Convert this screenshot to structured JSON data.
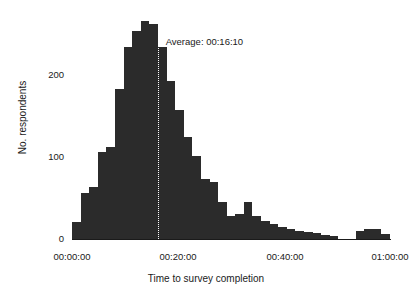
{
  "chart_data": {
    "type": "bar",
    "title": "",
    "subtitle": "",
    "xlabel": "Time to survey completion",
    "ylabel": "No. respondents",
    "xlim": [
      0,
      3600
    ],
    "ylim": [
      0,
      270
    ],
    "grid": false,
    "legend": "none",
    "bar_color": "#2b2b2b",
    "bin_width_seconds": 96,
    "x_tick_labels": [
      "00:00:00",
      "00:20:00",
      "00:40:00",
      "01:00:00"
    ],
    "x_tick_values": [
      0,
      1200,
      2400,
      3600
    ],
    "y_tick_labels": [
      "0",
      "100",
      "200"
    ],
    "y_tick_values": [
      0,
      100,
      200
    ],
    "annotations": [
      {
        "name": "average-line",
        "label": "Average: 00:16:10",
        "value_seconds": 970,
        "style": "dotted-vertical",
        "color": "#ffffff"
      }
    ],
    "categories": [
      "00:02:00",
      "00:03:36",
      "00:05:12",
      "00:06:48",
      "00:08:24",
      "00:10:00",
      "00:11:36",
      "00:13:12",
      "00:14:48",
      "00:16:24",
      "00:18:00",
      "00:19:36",
      "00:21:12",
      "00:22:48",
      "00:24:24",
      "00:26:00",
      "00:27:36",
      "00:29:12",
      "00:30:48",
      "00:32:24",
      "00:34:00",
      "00:35:36",
      "00:37:12",
      "00:38:48",
      "00:40:24",
      "00:42:00",
      "00:43:36",
      "00:45:12",
      "00:46:48",
      "00:48:24",
      "00:50:00",
      "00:51:36",
      "00:53:12",
      "00:54:48",
      "00:56:24",
      "00:58:00",
      "00:59:36"
    ],
    "values": [
      20,
      55,
      62,
      105,
      110,
      180,
      230,
      250,
      262,
      258,
      230,
      190,
      155,
      123,
      100,
      72,
      68,
      45,
      28,
      30,
      45,
      28,
      22,
      18,
      15,
      12,
      10,
      8,
      7,
      5,
      4,
      0,
      0,
      10,
      12,
      12,
      6
    ]
  },
  "axes": {
    "y_title": "No. respondents",
    "x_title": "Time to survey completion"
  }
}
